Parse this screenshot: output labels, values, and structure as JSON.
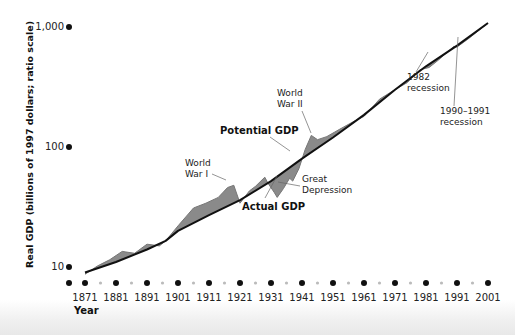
{
  "chart_data": {
    "type": "line",
    "title": "",
    "xlabel": "Year",
    "ylabel": "Real GDP (billions of 1997 dollars; ratio scale)",
    "yscale": "log",
    "ylim": [
      8,
      1100
    ],
    "xlim": [
      1866,
      2003
    ],
    "y_ticks": [
      {
        "value": 10,
        "label": "10"
      },
      {
        "value": 100,
        "label": "100"
      },
      {
        "value": 1000,
        "label": "1,000"
      }
    ],
    "x_ticks": [
      "1871",
      "1881",
      "1891",
      "1901",
      "1911",
      "1921",
      "1931",
      "1941",
      "1951",
      "1961",
      "1971",
      "1981",
      "1991",
      "2001"
    ],
    "grid": false,
    "legend": null,
    "series": [
      {
        "name": "Potential GDP",
        "color": "#111111",
        "x": [
          1871,
          1881,
          1891,
          1897,
          1901,
          1911,
          1921,
          1931,
          1941,
          1951,
          1961,
          1971,
          1981,
          1991,
          2001
        ],
        "values": [
          9,
          11,
          14,
          16.5,
          20,
          27,
          36,
          52,
          80,
          120,
          185,
          300,
          470,
          700,
          1080
        ]
      },
      {
        "name": "Actual GDP",
        "color": "#777777",
        "x": [
          1871,
          1875,
          1879,
          1883,
          1887,
          1891,
          1895,
          1897,
          1901,
          1906,
          1910,
          1914,
          1917,
          1919,
          1921,
          1924,
          1926,
          1929,
          1930,
          1932,
          1933,
          1935,
          1937,
          1938,
          1940,
          1942,
          1944,
          1946,
          1949,
          1953,
          1958,
          1961,
          1966,
          1970,
          1975,
          1979,
          1982,
          1985,
          1990,
          1991,
          1995,
          2001
        ],
        "values": [
          8.7,
          10.2,
          11.5,
          13.5,
          13,
          15.5,
          15,
          16.5,
          22,
          31,
          34,
          38,
          46,
          48,
          34,
          43,
          47,
          56,
          50,
          42,
          38,
          45,
          55,
          52,
          66,
          95,
          125,
          115,
          122,
          140,
          165,
          180,
          250,
          290,
          345,
          440,
          460,
          530,
          690,
          680,
          810,
          1080
        ]
      }
    ],
    "annotations": [
      {
        "text": "World War I",
        "lines": [
          "World",
          "War I"
        ],
        "year": 1918
      },
      {
        "text": "World War II",
        "lines": [
          "World",
          "War II"
        ],
        "year": 1944
      },
      {
        "text": "Potential GDP",
        "bold": true
      },
      {
        "text": "Actual GDP",
        "bold": true
      },
      {
        "text": "Great Depression",
        "lines": [
          "Great",
          "Depression"
        ],
        "year": 1933
      },
      {
        "text": "1982 recession",
        "lines": [
          "1982",
          "recession"
        ],
        "year": 1982
      },
      {
        "text": "1990–1991 recession",
        "lines": [
          "1990–1991",
          "recession"
        ],
        "year": 1991
      }
    ]
  }
}
